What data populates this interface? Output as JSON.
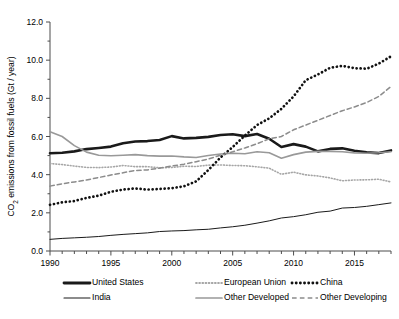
{
  "chart_data": {
    "type": "line",
    "title": "",
    "xlabel": "",
    "ylabel": "CO2 emissions from fossil fuels (Gt / year)",
    "ylabel_parts": {
      "pre": "CO",
      "sub": "2",
      "post": " emissions from fossil fuels (Gt / year)"
    },
    "xlim": [
      1990,
      2018
    ],
    "ylim": [
      0.0,
      12.0
    ],
    "ytick_values": [
      0.0,
      2.0,
      4.0,
      6.0,
      8.0,
      10.0,
      12.0
    ],
    "ytick_labels": [
      "0.0",
      "2.0",
      "4.0",
      "6.0",
      "8.0",
      "10.0",
      "12.0"
    ],
    "yminor_step": 1.0,
    "xtick_values": [
      1990,
      1995,
      2000,
      2005,
      2010,
      2015
    ],
    "xtick_labels": [
      "1990",
      "1995",
      "2000",
      "2005",
      "2010",
      "2015"
    ],
    "xminor_step": 1,
    "grid": false,
    "legend_position": "below",
    "x": [
      1990,
      1991,
      1992,
      1993,
      1994,
      1995,
      1996,
      1997,
      1998,
      1999,
      2000,
      2001,
      2002,
      2003,
      2004,
      2005,
      2006,
      2007,
      2008,
      2009,
      2010,
      2011,
      2012,
      2013,
      2014,
      2015,
      2016,
      2017,
      2018
    ],
    "series": [
      {
        "name": "United States",
        "style": "solid",
        "color": "#1a1a1a",
        "width": 2.6,
        "values": [
          5.12,
          5.15,
          5.22,
          5.34,
          5.4,
          5.47,
          5.65,
          5.74,
          5.76,
          5.82,
          6.02,
          5.9,
          5.93,
          5.98,
          6.08,
          6.12,
          6.02,
          6.13,
          5.88,
          5.45,
          5.6,
          5.47,
          5.22,
          5.35,
          5.38,
          5.25,
          5.17,
          5.13,
          5.27
        ]
      },
      {
        "name": "India",
        "style": "solid",
        "color": "#1a1a1a",
        "width": 1.0,
        "values": [
          0.61,
          0.66,
          0.69,
          0.72,
          0.76,
          0.82,
          0.87,
          0.91,
          0.95,
          1.02,
          1.05,
          1.07,
          1.11,
          1.14,
          1.21,
          1.27,
          1.35,
          1.46,
          1.58,
          1.73,
          1.8,
          1.9,
          2.03,
          2.09,
          2.25,
          2.28,
          2.34,
          2.43,
          2.52
        ]
      },
      {
        "name": "European Union",
        "style": "dotted-fine",
        "color": "#a6a6a6",
        "width": 1.6,
        "values": [
          4.58,
          4.53,
          4.45,
          4.38,
          4.37,
          4.4,
          4.48,
          4.42,
          4.42,
          4.36,
          4.38,
          4.44,
          4.43,
          4.5,
          4.51,
          4.48,
          4.47,
          4.41,
          4.34,
          4.02,
          4.13,
          3.99,
          3.93,
          3.83,
          3.68,
          3.72,
          3.73,
          3.76,
          3.62
        ]
      },
      {
        "name": "Other Developed",
        "style": "solid",
        "color": "#999999",
        "width": 1.6,
        "values": [
          6.25,
          6.0,
          5.52,
          5.18,
          5.02,
          4.99,
          5.02,
          5.05,
          5.0,
          4.97,
          4.98,
          4.93,
          4.9,
          5.0,
          5.08,
          5.12,
          5.1,
          5.2,
          5.15,
          4.86,
          5.05,
          5.18,
          5.22,
          5.22,
          5.2,
          5.14,
          5.12,
          5.15,
          5.2
        ]
      },
      {
        "name": "China",
        "style": "dotted-thick",
        "color": "#111111",
        "width": 2.7,
        "values": [
          2.42,
          2.55,
          2.62,
          2.78,
          2.9,
          3.1,
          3.22,
          3.28,
          3.22,
          3.25,
          3.29,
          3.39,
          3.65,
          4.24,
          4.9,
          5.45,
          6.05,
          6.6,
          6.95,
          7.45,
          8.1,
          8.95,
          9.25,
          9.6,
          9.7,
          9.58,
          9.55,
          9.82,
          10.2
        ]
      },
      {
        "name": "Other Developing",
        "style": "dashed",
        "color": "#8c8c8c",
        "width": 1.5,
        "values": [
          3.4,
          3.52,
          3.62,
          3.72,
          3.85,
          3.98,
          4.1,
          4.22,
          4.25,
          4.34,
          4.45,
          4.55,
          4.68,
          4.82,
          5.02,
          5.2,
          5.4,
          5.62,
          5.88,
          6.0,
          6.35,
          6.6,
          6.85,
          7.1,
          7.35,
          7.55,
          7.78,
          8.1,
          8.62
        ]
      }
    ],
    "legend": [
      {
        "label": "United States",
        "style": "solid",
        "color": "#1a1a1a",
        "width": 2.8
      },
      {
        "label": "European Union",
        "style": "dotted-fine",
        "color": "#a6a6a6",
        "width": 1.8
      },
      {
        "label": "China",
        "style": "dotted-thick",
        "color": "#111111",
        "width": 2.8
      },
      {
        "label": "India",
        "style": "solid",
        "color": "#1a1a1a",
        "width": 1.1
      },
      {
        "label": "Other Developed",
        "style": "solid",
        "color": "#999999",
        "width": 1.7
      },
      {
        "label": "Other Developing",
        "style": "dashed",
        "color": "#8c8c8c",
        "width": 1.6
      }
    ]
  }
}
